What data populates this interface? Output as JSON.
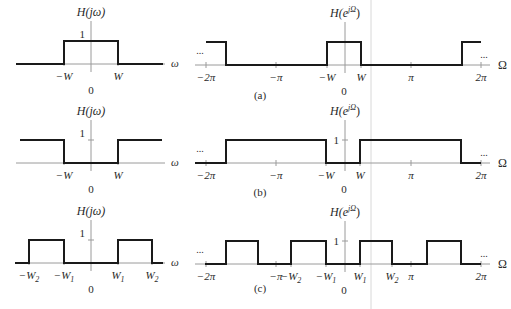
{
  "figure": {
    "guide_line_x": 371,
    "panels": [
      {
        "id": "a",
        "caption": "(a)",
        "caption_pos": [
          260,
          99
        ],
        "continuous": {
          "ylabel": "H(jω)",
          "xlabel": "ω",
          "one_label": "1",
          "zero_label": "0",
          "axis_x": 91,
          "base_y": 64,
          "top_y": 41,
          "x_start": 16,
          "x_end": 163,
          "ticks": [
            {
              "x": 64,
              "label": "−W"
            },
            {
              "x": 118,
              "label": "W"
            }
          ],
          "path": [
            [
              16,
              64
            ],
            [
              64,
              64
            ],
            [
              64,
              41
            ],
            [
              118,
              41
            ],
            [
              118,
              64
            ],
            [
              163,
              64
            ]
          ],
          "show_one_tick": false
        },
        "discrete": {
          "ylabel": "H(e^{jΩ})",
          "ylabel_main": "H(e",
          "ylabel_sup": "jΩ",
          "ylabel_close": ")",
          "xlabel": "Ω",
          "one_label": "",
          "zero_label": "0",
          "ellipsis_left": "...",
          "ellipsis_right": "...",
          "axis_x": 345,
          "base_y": 65,
          "top_y": 42,
          "x_start": 195,
          "x_end": 490,
          "ticks": [
            {
              "x": 206,
              "label": "−2π"
            },
            {
              "x": 276,
              "label": "−π"
            },
            {
              "x": 327,
              "label": "−W"
            },
            {
              "x": 361,
              "label": "W"
            },
            {
              "x": 411,
              "label": "π"
            },
            {
              "x": 481,
              "label": "2π"
            }
          ],
          "segments": [
            [
              [
                206,
                42
              ],
              [
                226,
                42
              ],
              [
                226,
                65
              ],
              [
                327,
                65
              ],
              [
                327,
                42
              ],
              [
                361,
                42
              ],
              [
                361,
                65
              ],
              [
                462,
                65
              ],
              [
                462,
                42
              ],
              [
                481,
                42
              ]
            ]
          ]
        }
      },
      {
        "id": "b",
        "caption": "(b)",
        "caption_pos": [
          260,
          196
        ],
        "continuous": {
          "ylabel": "H(jω)",
          "xlabel": "ω",
          "one_label": "1",
          "zero_label": "0",
          "axis_x": 91,
          "base_y": 163,
          "top_y": 140,
          "x_start": 16,
          "x_end": 163,
          "ticks": [
            {
              "x": 64,
              "label": "−W"
            },
            {
              "x": 118,
              "label": "W"
            }
          ],
          "path": [
            [
              20,
              140
            ],
            [
              64,
              140
            ],
            [
              64,
              163
            ],
            [
              118,
              163
            ],
            [
              118,
              140
            ],
            [
              162,
              140
            ]
          ],
          "show_one_tick": true
        },
        "discrete": {
          "ylabel_main": "H(e",
          "ylabel_sup": "jΩ",
          "ylabel_close": ")",
          "xlabel": "Ω",
          "one_label": "1",
          "zero_label": "0",
          "ellipsis_left": "...",
          "ellipsis_right": "...",
          "axis_x": 345,
          "base_y": 163,
          "top_y": 140,
          "x_start": 195,
          "x_end": 490,
          "ticks": [
            {
              "x": 206,
              "label": "−2π"
            },
            {
              "x": 276,
              "label": "−π"
            },
            {
              "x": 326,
              "label": "−W"
            },
            {
              "x": 360,
              "label": "W"
            },
            {
              "x": 411,
              "label": "π"
            },
            {
              "x": 481,
              "label": "2π"
            }
          ],
          "segments": [
            [
              [
                195,
                163
              ],
              [
                226,
                163
              ],
              [
                226,
                140
              ],
              [
                326,
                140
              ],
              [
                326,
                163
              ],
              [
                360,
                163
              ],
              [
                360,
                140
              ],
              [
                461,
                140
              ],
              [
                461,
                163
              ],
              [
                481,
                163
              ]
            ]
          ]
        }
      },
      {
        "id": "c",
        "caption": "(c)",
        "caption_pos": [
          260,
          292
        ],
        "continuous": {
          "ylabel": "H(jω)",
          "xlabel": "ω",
          "one_label": "1",
          "zero_label": "0",
          "axis_x": 91,
          "base_y": 263,
          "top_y": 240,
          "x_start": 15,
          "x_end": 163,
          "ticks": [
            {
              "x": 29,
              "label": "−W",
              "sub": "2"
            },
            {
              "x": 64,
              "label": "−W",
              "sub": "1"
            },
            {
              "x": 118,
              "label": "W",
              "sub": "1"
            },
            {
              "x": 152,
              "label": "W",
              "sub": "2"
            }
          ],
          "path": [
            [
              15,
              263
            ],
            [
              29,
              263
            ],
            [
              29,
              240
            ],
            [
              64,
              240
            ],
            [
              64,
              263
            ],
            [
              118,
              263
            ],
            [
              118,
              240
            ],
            [
              152,
              240
            ],
            [
              152,
              263
            ],
            [
              163,
              263
            ]
          ],
          "show_one_tick": true
        },
        "discrete": {
          "ylabel_main": "H(e",
          "ylabel_sup": "jΩ",
          "ylabel_close": ")",
          "xlabel": "Ω",
          "one_label": "1",
          "zero_label": "0",
          "ellipsis_left": "...",
          "ellipsis_right": "...",
          "axis_x": 345,
          "base_y": 264,
          "top_y": 241,
          "x_start": 195,
          "x_end": 490,
          "ticks": [
            {
              "x": 206,
              "label": "−2π"
            },
            {
              "x": 276,
              "label": "−π"
            },
            {
              "x": 291,
              "label": "−W",
              "sub": "2"
            },
            {
              "x": 326,
              "label": "−W",
              "sub": "1"
            },
            {
              "x": 360,
              "label": "W",
              "sub": "1"
            },
            {
              "x": 392,
              "label": "W",
              "sub": "2"
            },
            {
              "x": 411,
              "label": "π"
            },
            {
              "x": 481,
              "label": "2π"
            }
          ],
          "segments": [
            [
              [
                205,
                264
              ],
              [
                226,
                264
              ],
              [
                226,
                241
              ],
              [
                258,
                241
              ],
              [
                258,
                264
              ],
              [
                291,
                264
              ],
              [
                291,
                241
              ],
              [
                326,
                241
              ],
              [
                326,
                264
              ],
              [
                360,
                264
              ],
              [
                360,
                241
              ],
              [
                392,
                241
              ],
              [
                392,
                264
              ],
              [
                427,
                264
              ],
              [
                427,
                241
              ],
              [
                461,
                241
              ],
              [
                461,
                264
              ],
              [
                481,
                264
              ]
            ]
          ]
        }
      }
    ]
  }
}
